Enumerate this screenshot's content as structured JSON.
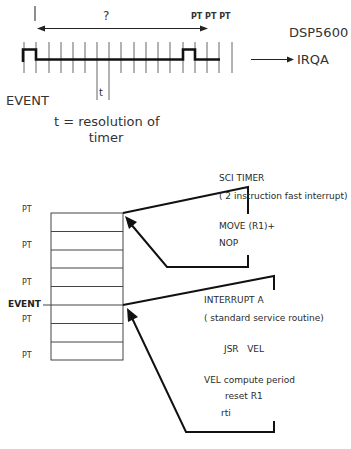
{
  "timing": {
    "interval_label": "?",
    "pt_labels": "PT PT PT",
    "device_label": "DSP5600",
    "output_label": "IRQA",
    "event_label": "EVENT",
    "tick_label": "t",
    "resolution_line1": "t = resolution of",
    "resolution_line2": "timer"
  },
  "buffer": {
    "pt_labels": [
      "PT",
      "PT",
      "PT",
      "PT",
      "PT"
    ],
    "event_label": "EVENT",
    "rows": 8
  },
  "sci_timer": {
    "title": "SCI TIMER",
    "subtitle": "( 2 instruction fast interrupt)",
    "code": [
      "MOVE (R1)+",
      "NOP"
    ]
  },
  "interrupt_a": {
    "title": "INTERRUPT A",
    "subtitle": "( standard service routine)",
    "call": "JSR   VEL",
    "routine_title": "VEL compute period",
    "routine_lines": [
      "reset R1",
      "rti"
    ]
  },
  "colors": {
    "line": "#1a1a1a",
    "tick": "#555555",
    "text": "#333333",
    "background": "#ffffff"
  }
}
